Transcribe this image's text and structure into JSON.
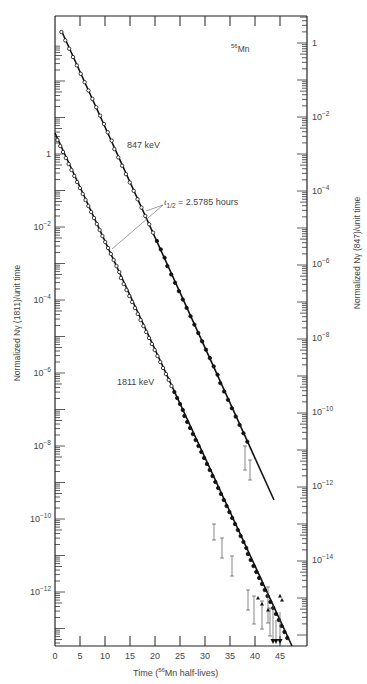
{
  "chart_data": {
    "type": "scatter",
    "title": "",
    "annotation_isotope": "56Mn",
    "annotation_halflife": "t1/2 = 2.5785 hours",
    "xlabel": "Time (56Mn half-lives)",
    "ylabel_left": "Normalized Nγ (1811)/unit time",
    "ylabel_right": "Normalized Nγ (847)/unit time",
    "xlim": [
      0,
      50
    ],
    "x_ticks": [
      0,
      5,
      10,
      15,
      20,
      25,
      30,
      35,
      40,
      45
    ],
    "y_left_scale": "log",
    "y_left_ticks": [
      "1",
      "10^-2",
      "10^-4",
      "10^-6",
      "10^-8",
      "10^-10",
      "10^-12"
    ],
    "y_right_scale": "log",
    "y_right_ticks": [
      "1",
      "10^-2",
      "10^-4",
      "10^-6",
      "10^-8",
      "10^-10",
      "10^-12",
      "10^-14"
    ],
    "grid": false,
    "series": [
      {
        "name": "847 keV",
        "axis": "right",
        "x": [
          1,
          3,
          5,
          7,
          9,
          11,
          13,
          15,
          17,
          19,
          21,
          23,
          25,
          27,
          29,
          31,
          33,
          35,
          37,
          38
        ],
        "y": [
          1.5,
          0.7,
          0.25,
          0.09,
          0.03,
          0.012,
          0.004,
          0.0015,
          0.0006,
          0.0002,
          7e-05,
          3e-05,
          1e-05,
          4e-06,
          1.5e-06,
          5e-07,
          2e-07,
          7e-08,
          3e-08,
          2e-08
        ],
        "fit_line": {
          "x": [
            1,
            44
          ],
          "y": [
            2.0,
            1e-13
          ]
        }
      },
      {
        "name": "1811 keV",
        "axis": "left",
        "x": [
          2,
          4,
          6,
          8,
          10,
          12,
          14,
          16,
          18,
          20,
          22,
          24,
          26,
          28,
          30,
          32,
          34,
          36,
          38,
          40,
          42,
          44
        ],
        "y": [
          1.0,
          0.25,
          0.06,
          0.015,
          0.004,
          0.001,
          0.00025,
          6e-05,
          1.5e-05,
          4e-06,
          1e-06,
          2.5e-07,
          6e-08,
          1.5e-08,
          4e-09,
          1e-09,
          2.5e-10,
          6e-11,
          1.5e-11,
          4e-12,
          1e-12,
          2.5e-13
        ],
        "fit_line": {
          "x": [
            0,
            47.5
          ],
          "y": [
            4.0,
            2e-14
          ]
        }
      }
    ],
    "labels": {
      "series_847": "847 keV",
      "series_1811": "1811 keV"
    }
  },
  "text": {
    "isotope_mass": "56",
    "isotope_symbol": "Mn",
    "series_847": "847 keV",
    "series_1811": "1811 keV",
    "halflife_t": "t",
    "halflife_sub": "1/2",
    "halflife_rest": " = 2.5785 hours",
    "xlabel_pre": "Time (",
    "xlabel_sup": "56",
    "xlabel_post": "Mn half-lives)",
    "ylabel_left": "Normalized Nγ (1811)/unit time",
    "ylabel_right": "Normalized Nγ (847)/unit time",
    "x_tick_labels": [
      "0",
      "5",
      "10",
      "15",
      "20",
      "25",
      "30",
      "35",
      "40",
      "45"
    ],
    "y_left_labels": [
      {
        "base": "1",
        "exp": "",
        "y": 154
      },
      {
        "base": "10",
        "exp": "−2",
        "y": 227
      },
      {
        "base": "10",
        "exp": "−4",
        "y": 300
      },
      {
        "base": "10",
        "exp": "−6",
        "y": 373
      },
      {
        "base": "10",
        "exp": "−8",
        "y": 446
      },
      {
        "base": "10",
        "exp": "−10",
        "y": 519
      },
      {
        "base": "10",
        "exp": "−12",
        "y": 592
      }
    ],
    "y_right_labels": [
      {
        "base": "1",
        "exp": "",
        "y": 43
      },
      {
        "base": "10",
        "exp": "−2",
        "y": 117
      },
      {
        "base": "10",
        "exp": "−4",
        "y": 191
      },
      {
        "base": "10",
        "exp": "−6",
        "y": 264
      },
      {
        "base": "10",
        "exp": "−8",
        "y": 338
      },
      {
        "base": "10",
        "exp": "−10",
        "y": 412
      },
      {
        "base": "10",
        "exp": "−12",
        "y": 486
      },
      {
        "base": "10",
        "exp": "−14",
        "y": 560
      }
    ]
  }
}
